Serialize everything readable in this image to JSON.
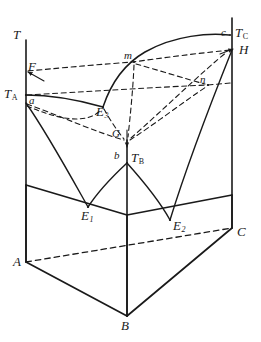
{
  "figure": {
    "kind": "ternary-phase-diagram-prism",
    "background_color": "#ffffff",
    "line_color": "#1a1a1a"
  },
  "axes": {
    "temperature_axis_label": "T",
    "vertical_axes": [
      {
        "name": "A-axis",
        "x": 26,
        "top_y": 40,
        "bottom_y": 262
      },
      {
        "name": "B-axis",
        "x": 127,
        "top_y": 140,
        "bottom_y": 316
      },
      {
        "name": "C-axis",
        "x": 232,
        "top_y": 18,
        "bottom_y": 228
      }
    ]
  },
  "labels": {
    "temperature": {
      "text": "T",
      "x": 13,
      "y": 30
    },
    "melting_A": {
      "text": "T",
      "subscript": "A",
      "x": 6,
      "y": 88
    },
    "melting_B": {
      "text": "T",
      "subscript": "B",
      "x": 132,
      "y": 152
    },
    "melting_C": {
      "text": "T",
      "subscript": "C",
      "x": 236,
      "y": 26
    },
    "point_F": {
      "text": "F",
      "x": 28,
      "y": 62
    },
    "point_a": {
      "text": "a",
      "x": 29,
      "y": 95
    },
    "point_b": {
      "text": "b",
      "x": 114,
      "y": 150
    },
    "point_c": {
      "text": "c",
      "x": 222,
      "y": 28
    },
    "point_G": {
      "text": "G",
      "x": 111,
      "y": 128
    },
    "point_H": {
      "text": "H",
      "x": 240,
      "y": 44
    },
    "point_m": {
      "text": "m",
      "x": 125,
      "y": 51
    },
    "point_n": {
      "text": "n",
      "x": 200,
      "y": 76
    },
    "eutectic_1": {
      "text": "E",
      "subscript": "1",
      "x": 82,
      "y": 210
    },
    "eutectic_2": {
      "text": "E",
      "subscript": "2",
      "x": 174,
      "y": 220
    },
    "eutectic_3": {
      "text": "E",
      "subscript": "3",
      "x": 97,
      "y": 106
    },
    "corner_A": {
      "text": "A",
      "x": 14,
      "y": 256
    },
    "corner_B": {
      "text": "B",
      "x": 121,
      "y": 320
    },
    "corner_C": {
      "text": "C",
      "x": 237,
      "y": 226
    }
  },
  "geometry": {
    "prism_vertices": {
      "A_bottom": [
        26,
        262
      ],
      "B_bottom": [
        127,
        316
      ],
      "C_bottom": [
        232,
        228
      ],
      "A_top": [
        26,
        185
      ],
      "B_top": [
        127,
        245
      ],
      "C_top": [
        232,
        195
      ],
      "A_axis_top": [
        26,
        40
      ],
      "B_axis_top": [
        127,
        140
      ],
      "C_axis_top": [
        232,
        18
      ]
    },
    "points": {
      "T_A": [
        26,
        95
      ],
      "T_B": [
        127,
        163
      ],
      "T_C": [
        232,
        35
      ],
      "F": [
        26,
        72
      ],
      "a": [
        26,
        103
      ],
      "b": [
        127,
        163
      ],
      "c": [
        228,
        35
      ],
      "G": [
        127,
        141
      ],
      "H": [
        232,
        50
      ],
      "m": [
        133,
        62
      ],
      "n": [
        208,
        85
      ],
      "E1": [
        88,
        207
      ],
      "E2": [
        170,
        220
      ],
      "E3": [
        103,
        107
      ]
    }
  },
  "solid_paths": {
    "prism_base_A_B": "M 26 262 L 127 316",
    "prism_base_B_C": "M 127 316 L 232 228",
    "prism_left_vertical": "M 26 185 L 26 262",
    "prism_center_vertical": "M 127 245 L 127 316",
    "prism_right_vertical": "M 232 195 L 232 228",
    "prism_top_A_B": "M 26 185 L 127 215",
    "prism_top_B_C": "M 127 215 L 232 195",
    "liquidus_TA_E3": "M 26 95 Q 62 110 103 107",
    "liquidus_TC_E3": "M 232 35 Q 175 33 133 62 Q 112 80 103 107",
    "binary_AB_A_branch": "M 26 103 Q 55 150 88 207",
    "binary_AB_B_branch": "M 127 163 Q 104 180 88 207",
    "binary_BC_B_branch": "M 127 163 Q 148 188 170 220",
    "binary_BC_C_branch": "M 232 50 Q 196 120 170 220"
  },
  "dashed_paths": {
    "base_diagonal_A_C": "M 26 262 L 232 228",
    "isotherm_F_to_H": "M 26 72 L 133 62 L 232 50",
    "isotherm_TA_to_n": "M 26 95 L 208 85",
    "isotherm_a_to_G_to_n": "M 26 103 L 127 141 L 208 85",
    "tie_m_to_n": "M 133 62 L 208 85",
    "tie_m_to_G": "M 133 62 L 127 141",
    "ray_G_to_H": "M 127 141 L 232 50",
    "ray_F_arrow": "M 40 78 L 26 72",
    "ray_H_arrow": "M 222 50 L 234 48",
    "ray_G_arrow": "M 127 128 L 127 145"
  },
  "annotations": {
    "arrow_heads": [
      {
        "name": "arrow-to-F",
        "at": [
          27,
          72
        ]
      },
      {
        "name": "arrow-to-H",
        "at": [
          234,
          48
        ]
      },
      {
        "name": "arrow-to-G-axis",
        "at": [
          127,
          146
        ]
      }
    ]
  }
}
